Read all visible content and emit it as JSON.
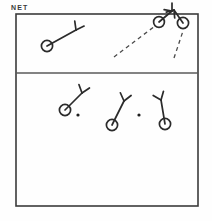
{
  "labels": {
    "net": "NET"
  },
  "colors": {
    "court_line": "#3b3b3b",
    "net_line": "#5a5a5a",
    "player_stroke": "#2b2b2b",
    "trajectory": "#4a4a4a",
    "shuttle": "#1f1f1f",
    "background": "#fefefe",
    "label_text": "#3a3a3a"
  },
  "court": {
    "name": "badminton-court",
    "left": 16,
    "top": 14,
    "right": 198,
    "bottom": 206,
    "border_width": 1.6,
    "net_y": 73,
    "net_width": 1.4
  },
  "diagram": {
    "title": "NET"
  },
  "players": [
    {
      "id": "far-left-player",
      "side": "far",
      "body_x": 47,
      "body_y": 46,
      "body_r": 5.6,
      "arm_to_x": 76,
      "arm_to_y": 30,
      "racket_angle": 28,
      "racket_len": 9,
      "racket_spread": 36
    },
    {
      "id": "far-right-player-a",
      "side": "far",
      "body_x": 159,
      "body_y": 22,
      "body_r": 5.4,
      "arm_to_x": 172,
      "arm_to_y": 11,
      "racket_angle": -40,
      "racket_len": 8,
      "racket_spread": 40
    },
    {
      "id": "far-right-player-b",
      "side": "far",
      "body_x": 183,
      "body_y": 23,
      "body_r": 5.6,
      "arm_to_x": 174,
      "arm_to_y": 10,
      "racket_angle": 215,
      "racket_len": 8,
      "racket_spread": 40
    },
    {
      "id": "near-left-player",
      "side": "near",
      "body_x": 65,
      "body_y": 110,
      "body_r": 5.6,
      "arm_to_x": 82,
      "arm_to_y": 93,
      "racket_angle": 18,
      "racket_len": 9,
      "racket_spread": 38
    },
    {
      "id": "near-middle-player",
      "side": "near",
      "body_x": 112,
      "body_y": 125,
      "body_r": 5.6,
      "arm_to_x": 124,
      "arm_to_y": 101,
      "racket_angle": 14,
      "racket_len": 9,
      "racket_spread": 38
    },
    {
      "id": "near-right-player",
      "side": "near",
      "body_x": 165,
      "body_y": 124,
      "body_r": 5.6,
      "arm_to_x": 161,
      "arm_to_y": 100,
      "racket_angle": -22,
      "racket_len": 9,
      "racket_spread": 38
    }
  ],
  "trajectories": [
    {
      "id": "shuttle-path-long",
      "style": "dashed",
      "from_x": 114,
      "from_y": 57,
      "to_x": 155,
      "to_y": 26
    },
    {
      "id": "shuttle-path-short",
      "style": "dashed",
      "from_x": 174,
      "from_y": 58,
      "to_x": 183,
      "to_y": 31
    }
  ],
  "shuttles": [
    {
      "id": "shuttle-marker-left",
      "x": 78,
      "y": 115,
      "r": 1.6
    },
    {
      "id": "shuttle-marker-right",
      "x": 139,
      "y": 115,
      "r": 1.6
    }
  ]
}
